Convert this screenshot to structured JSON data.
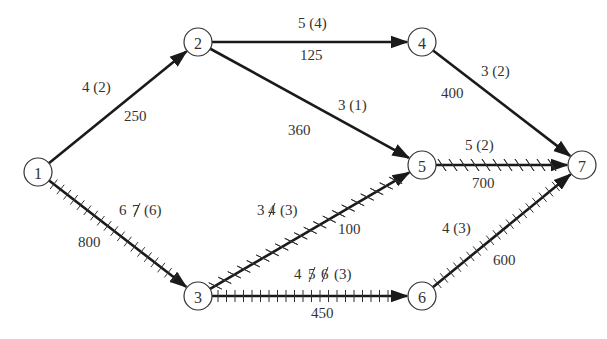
{
  "diagram": {
    "type": "project-network",
    "colors": {
      "line": "#1a1a1a",
      "text": "#333333",
      "background": "#ffffff"
    },
    "nodes": [
      {
        "id": "1",
        "label": "1",
        "x": 38,
        "y": 172
      },
      {
        "id": "2",
        "label": "2",
        "x": 198,
        "y": 42
      },
      {
        "id": "3",
        "label": "3",
        "x": 198,
        "y": 296
      },
      {
        "id": "4",
        "label": "4",
        "x": 422,
        "y": 42
      },
      {
        "id": "5",
        "label": "5",
        "x": 422,
        "y": 165
      },
      {
        "id": "6",
        "label": "6",
        "x": 422,
        "y": 296
      },
      {
        "id": "7",
        "label": "7",
        "x": 582,
        "y": 165
      }
    ],
    "edges": [
      {
        "from": "1",
        "to": "2",
        "duration_label": "4 (2)",
        "cost": "250",
        "hatch": "none"
      },
      {
        "from": "1",
        "to": "3",
        "duration_label": "6 7 (6)",
        "struck": [
          "7"
        ],
        "cost": "800",
        "hatch": "ticks"
      },
      {
        "from": "2",
        "to": "4",
        "duration_label": "5 (4)",
        "cost": "125",
        "hatch": "none"
      },
      {
        "from": "2",
        "to": "5",
        "duration_label": "3 (1)",
        "cost": "360",
        "hatch": "none"
      },
      {
        "from": "3",
        "to": "5",
        "duration_label": "3 4 (3)",
        "struck": [
          "4"
        ],
        "cost": "100",
        "hatch": "x"
      },
      {
        "from": "3",
        "to": "6",
        "duration_label": "4 5 6 (3)",
        "struck": [
          "5",
          "6"
        ],
        "cost": "450",
        "hatch": "ticks"
      },
      {
        "from": "4",
        "to": "7",
        "duration_label": "3 (2)",
        "cost": "400",
        "hatch": "none"
      },
      {
        "from": "5",
        "to": "7",
        "duration_label": "5 (2)",
        "cost": "700",
        "hatch": "x"
      },
      {
        "from": "6",
        "to": "7",
        "duration_label": "4 (3)",
        "cost": "600",
        "hatch": "ticks"
      }
    ],
    "labels": {
      "e12_dur": "4 (2)",
      "e12_cost": "250",
      "e13_dur_a": "6",
      "e13_dur_struck": "7",
      "e13_dur_b": "(6)",
      "e13_cost": "800",
      "e24_dur": "5 (4)",
      "e24_cost": "125",
      "e25_dur": "3 (1)",
      "e25_cost": "360",
      "e35_dur_a": "3",
      "e35_dur_struck": "4",
      "e35_dur_b": "(3)",
      "e35_cost": "100",
      "e36_dur_a": "4",
      "e36_dur_struck1": "5",
      "e36_dur_struck2": "6",
      "e36_dur_b": "(3)",
      "e36_cost": "450",
      "e47_dur": "3 (2)",
      "e47_cost": "400",
      "e57_dur": "5 (2)",
      "e57_cost": "700",
      "e67_dur": "4 (3)",
      "e67_cost": "600"
    }
  }
}
